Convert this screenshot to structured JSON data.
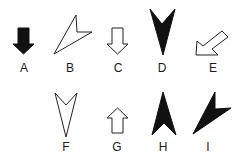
{
  "figure": {
    "colors": {
      "fill_dark": "#111111",
      "stroke": "#222222",
      "background": "#ffffff"
    },
    "items": [
      {
        "label": "A",
        "shape": "block-arrow-down",
        "style": "filled"
      },
      {
        "label": "B",
        "shape": "arrowhead-pointing-up-right",
        "style": "outline"
      },
      {
        "label": "C",
        "shape": "block-arrow-down",
        "style": "outline"
      },
      {
        "label": "D",
        "shape": "arrowhead-pointing-down",
        "style": "filled"
      },
      {
        "label": "E",
        "shape": "block-arrow-down-left",
        "style": "outline"
      },
      {
        "label": "F",
        "shape": "arrowhead-pointing-down",
        "style": "outline"
      },
      {
        "label": "G",
        "shape": "block-arrow-up",
        "style": "outline"
      },
      {
        "label": "H",
        "shape": "arrowhead-pointing-up",
        "style": "filled"
      },
      {
        "label": "I",
        "shape": "arrowhead-pointing-up-right",
        "style": "filled"
      }
    ]
  }
}
